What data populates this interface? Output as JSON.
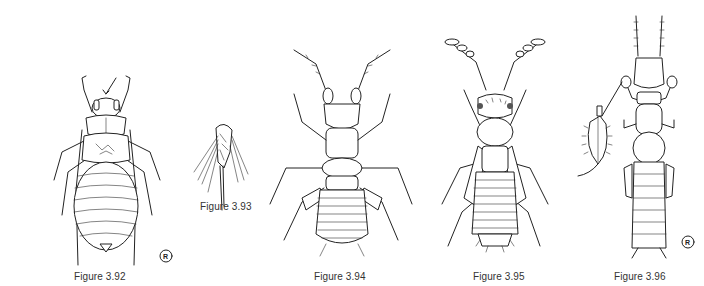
{
  "page": {
    "background": "#ffffff",
    "line_color": "#222222"
  },
  "figures": [
    {
      "id": "3.92",
      "caption": "Figure 3.92",
      "subject": "louse-like insect, dorsal view, arrow pointing to head",
      "has_artist_mark": true,
      "artist_mark": "R"
    },
    {
      "id": "3.93",
      "caption": "Figure 3.93",
      "subject": "detail of appendage with long setae"
    },
    {
      "id": "3.94",
      "caption": "Figure 3.94",
      "subject": "wingless elongate insect, dorsal view"
    },
    {
      "id": "3.95",
      "caption": "Figure 3.95",
      "subject": "winged insect with segmented antennae, dorsal view"
    },
    {
      "id": "3.96",
      "caption": "Figure 3.96",
      "subject": "slender insect with inset of enlarged foreleg segment",
      "has_artist_mark": true,
      "artist_mark": "R"
    }
  ]
}
